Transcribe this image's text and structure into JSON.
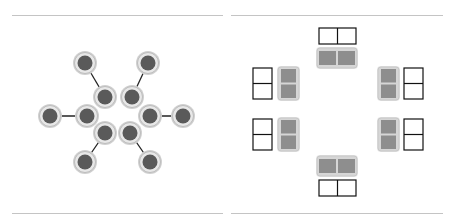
{
  "figure": {
    "panels": [
      {
        "name": "hexagonal-cluster",
        "description": "Six inner nodes arranged in a hexagon ring, each with one outer node connected by a line",
        "inner_nodes": [
          [
            105,
            97
          ],
          [
            132,
            97
          ],
          [
            87,
            116
          ],
          [
            150,
            116
          ],
          [
            105,
            133
          ],
          [
            130,
            133
          ]
        ],
        "outer_nodes": [
          [
            85,
            63
          ],
          [
            148,
            63
          ],
          [
            50,
            116
          ],
          [
            183,
            116
          ],
          [
            85,
            162
          ],
          [
            150,
            162
          ]
        ],
        "links": [
          [
            0,
            0
          ],
          [
            1,
            1
          ],
          [
            2,
            2
          ],
          [
            3,
            3
          ],
          [
            4,
            4
          ],
          [
            5,
            5
          ]
        ],
        "node_fill": "#5a5a5a",
        "ring_fill": "#e8e8e8",
        "ring_stroke": "#bdbdbd"
      },
      {
        "name": "paired-blocks",
        "description": "Six gray two-cell blocks arranged in a ring, each with an adjacent empty outlined two-cell block",
        "block_fill": "#8e8e8e",
        "block_frame": "#d6d6d6",
        "outline_stroke": "#111111"
      }
    ],
    "rule_color": "#c4c4c4"
  }
}
